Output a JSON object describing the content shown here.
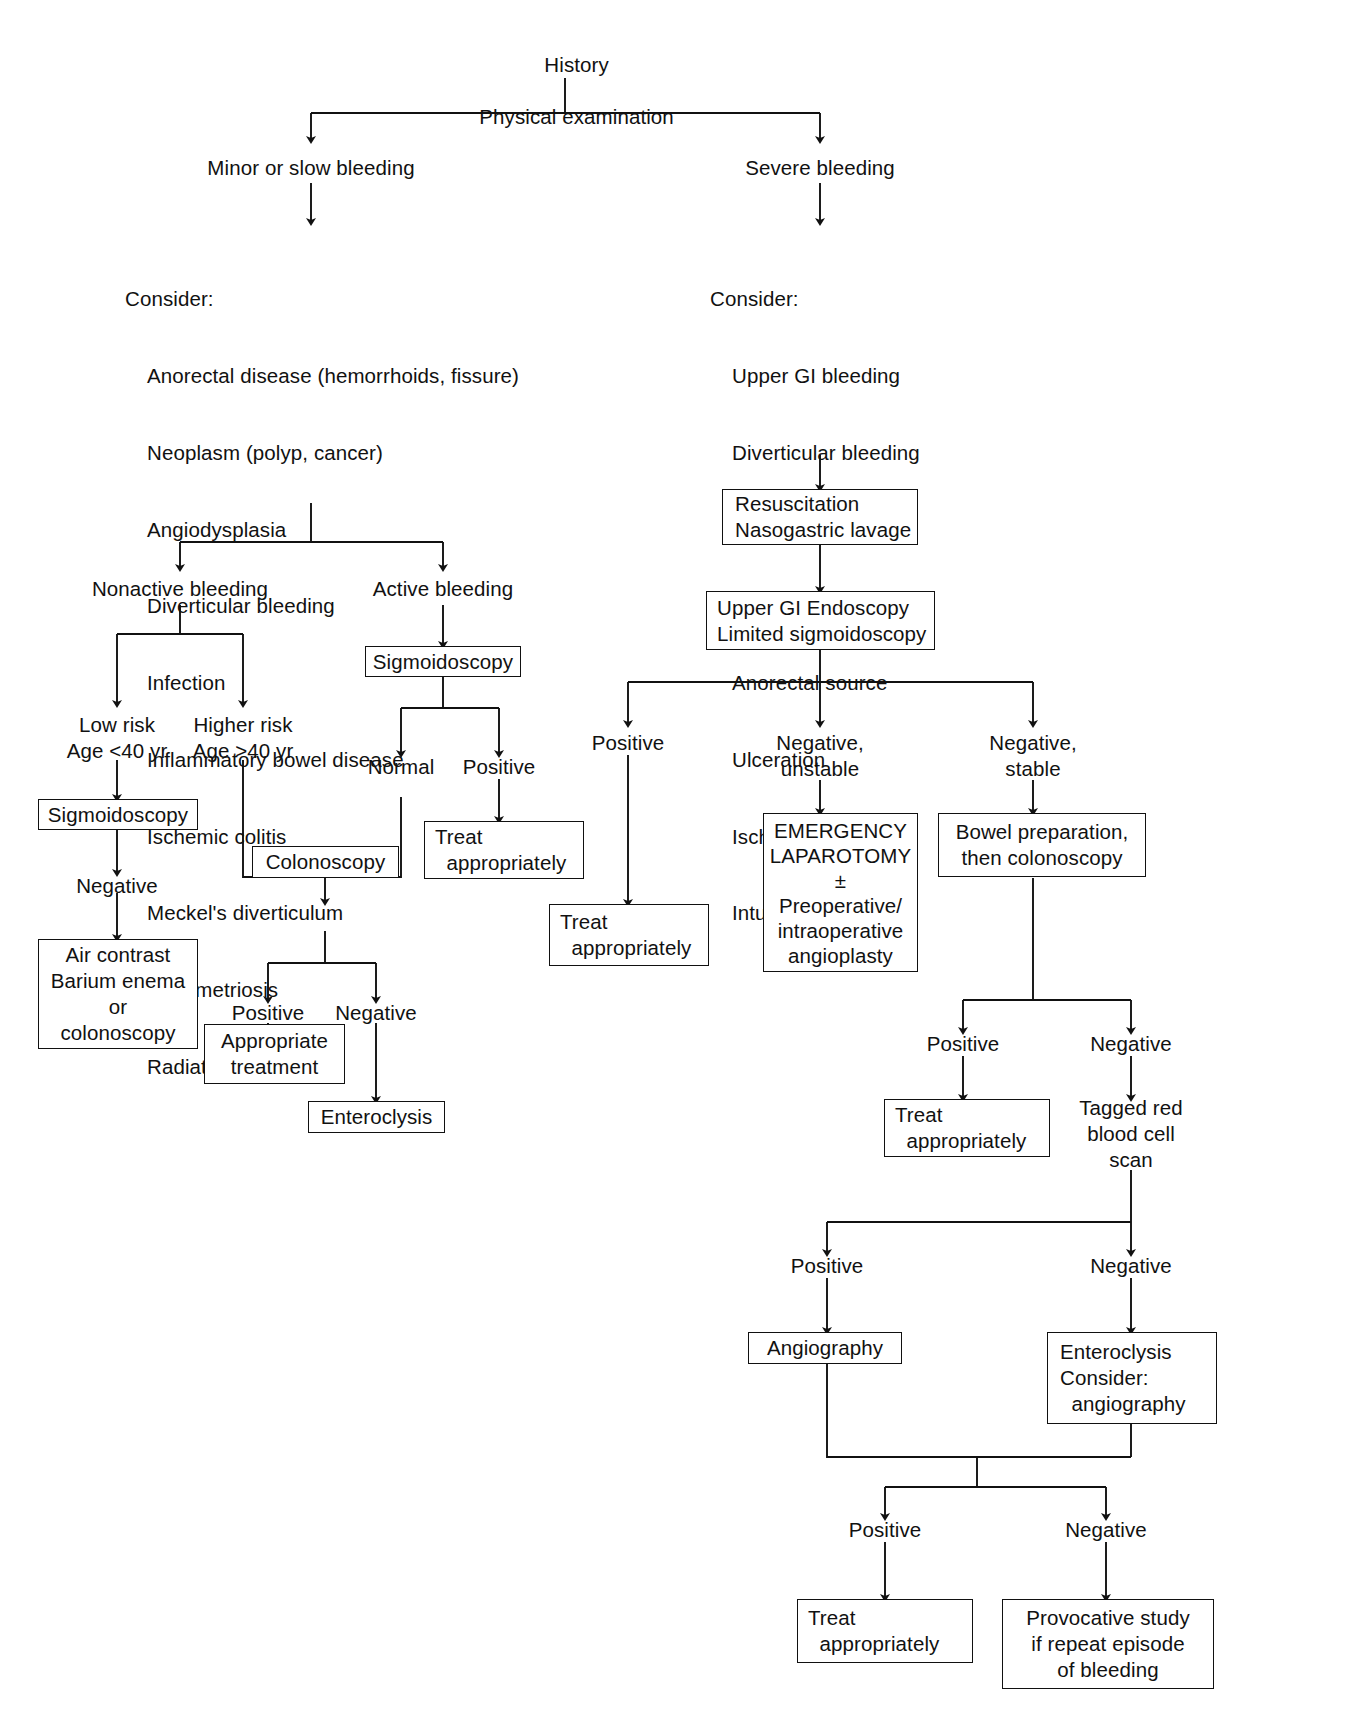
{
  "diagram": {
    "root": {
      "line1": "History",
      "line2": "Physical examination"
    },
    "branches": {
      "minor": "Minor or slow bleeding",
      "severe": "Severe bleeding"
    },
    "consider_minor": {
      "header": "Consider:",
      "items": [
        "Anorectal disease (hemorrhoids, fissure)",
        "Neoplasm (polyp, cancer)",
        "Angiodysplasia",
        "Diverticular bleeding",
        "Infection",
        "Inflammatory bowel disease",
        "Ischemic colitis",
        "Meckel's diverticulum",
        "Endometriosis",
        "Radiation proctitis"
      ]
    },
    "consider_severe": {
      "header": "Consider:",
      "items": [
        "Upper GI bleeding",
        "Diverticular bleeding",
        "Angiodysplasia",
        "Neoplasm",
        "Anorectal source",
        "Ulceration",
        "Ischemic colitis",
        "Intussusception"
      ]
    },
    "left": {
      "nonactive": "Nonactive bleeding",
      "active": "Active bleeding",
      "low_risk": "Low risk\nAge <40 yr",
      "higher_risk": "Higher risk\nAge >40 yr",
      "sigmoidoscopy_low": "Sigmoidoscopy",
      "negative_1": "Negative",
      "air_contrast": "Air contrast\nBarium enema\nor\ncolonoscopy",
      "sigmoidoscopy_active": "Sigmoidoscopy",
      "normal": "Normal",
      "positive_active": "Positive",
      "treat_active": "Treat\n  appropriately",
      "colonoscopy": "Colonoscopy",
      "positive_colon": "Positive",
      "negative_colon": "Negative",
      "appropriate_treatment": "Appropriate\ntreatment",
      "enteroclysis": "Enteroclysis"
    },
    "right": {
      "resuscitation": "Resuscitation\nNasogastric lavage",
      "upper_gi": "Upper GI Endoscopy\nLimited sigmoidoscopy",
      "positive": "Positive",
      "negative_unstable": "Negative,\nunstable",
      "negative_stable": "Negative,\nstable",
      "treat_positive": "Treat\n  appropriately",
      "emergency_laparotomy": "EMERGENCY\nLAPAROTOMY\n±\nPreoperative/\nintraoperative\nangioplasty",
      "bowel_prep": "Bowel preparation,\nthen colonoscopy",
      "positive_bowel": "Positive",
      "negative_bowel": "Negative",
      "treat_bowel": "Treat\n  appropriately",
      "tagged_rbc": "Tagged red\nblood cell\nscan",
      "positive_tagged": "Positive",
      "negative_tagged": "Negative",
      "angiography": "Angiography",
      "enteroclysis_consider": "Enteroclysis\nConsider:\n  angiography",
      "positive_final": "Positive",
      "negative_final": "Negative",
      "treat_final": "Treat\n  appropriately",
      "provocative_study": "Provocative study\nif repeat episode\nof bleeding"
    },
    "colors": {
      "line": "#111111",
      "text": "#111111",
      "background": "#ffffff"
    }
  }
}
